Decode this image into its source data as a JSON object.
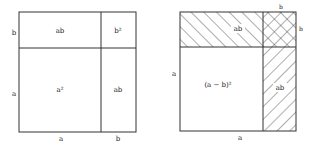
{
  "left_figure": {
    "top_label_left": "ab",
    "top_label_right": "b²",
    "center_label": "a²",
    "right_label": "ab",
    "side_top": "b",
    "side_main": "a",
    "bottom_left": "a",
    "bottom_right": "b"
  },
  "right_figure": {
    "top_label": "ab",
    "right_label": "ab",
    "center_label": "(a − b)²",
    "corner_top": "b",
    "corner_right": "b",
    "side_main": "a",
    "bottom": "a"
  },
  "colors": {
    "stroke": "#333333",
    "hatch": "#333333",
    "background": "#ffffff"
  }
}
